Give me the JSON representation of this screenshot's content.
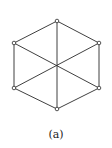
{
  "figure": {
    "caption": "(a)",
    "colors": {
      "edge": "#2a2a2a",
      "vertex_fill": "#ffffff",
      "background": "#ffffff"
    },
    "vertices": [
      {
        "id": "v-top",
        "x": 57,
        "y": 21
      },
      {
        "id": "v-upper-right",
        "x": 99,
        "y": 43
      },
      {
        "id": "v-lower-right",
        "x": 99,
        "y": 88
      },
      {
        "id": "v-bottom",
        "x": 57,
        "y": 109
      },
      {
        "id": "v-lower-left",
        "x": 14,
        "y": 88
      },
      {
        "id": "v-upper-left",
        "x": 14,
        "y": 43
      }
    ],
    "edges": [
      [
        0,
        1
      ],
      [
        1,
        2
      ],
      [
        2,
        3
      ],
      [
        3,
        4
      ],
      [
        4,
        5
      ],
      [
        5,
        0
      ],
      [
        0,
        3
      ],
      [
        1,
        4
      ],
      [
        2,
        5
      ]
    ]
  }
}
